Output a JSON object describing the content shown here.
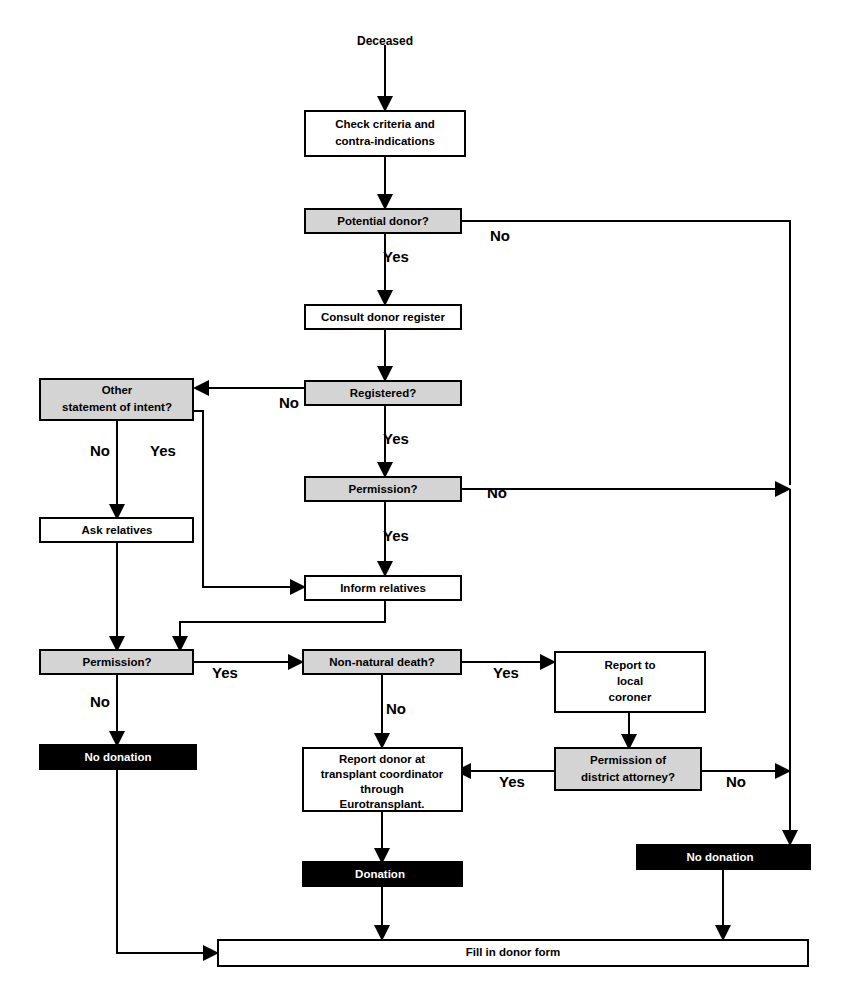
{
  "diagram": {
    "start_label": "Deceased",
    "colors": {
      "decision_fill": "#d4d4d4",
      "process_fill": "#ffffff",
      "terminal_fill": "#000000",
      "terminal_text": "#ffffff",
      "line": "#000000"
    },
    "nodes": [
      {
        "id": "start",
        "kind": "label",
        "lines": [
          "Deceased"
        ],
        "x": 305,
        "y": 30,
        "w": 160,
        "h": 24
      },
      {
        "id": "check_criteria",
        "kind": "process",
        "lines": [
          "Check criteria and",
          "contra-indications"
        ],
        "x": 305,
        "y": 111,
        "w": 160,
        "h": 45
      },
      {
        "id": "potential_donor",
        "kind": "decision",
        "lines": [
          "Potential donor?"
        ],
        "x": 305,
        "y": 209,
        "w": 156,
        "h": 24
      },
      {
        "id": "consult_register",
        "kind": "process",
        "lines": [
          "Consult donor register"
        ],
        "x": 305,
        "y": 305,
        "w": 156,
        "h": 24
      },
      {
        "id": "registered",
        "kind": "decision",
        "lines": [
          "Registered?"
        ],
        "x": 305,
        "y": 381,
        "w": 156,
        "h": 24
      },
      {
        "id": "other_statement",
        "kind": "decision",
        "lines": [
          "Other",
          "statement of intent?"
        ],
        "x": 40,
        "y": 379,
        "w": 153,
        "h": 41
      },
      {
        "id": "permission_reg",
        "kind": "decision",
        "lines": [
          "Permission?"
        ],
        "x": 305,
        "y": 477,
        "w": 156,
        "h": 24
      },
      {
        "id": "ask_relatives",
        "kind": "process",
        "lines": [
          "Ask relatives"
        ],
        "x": 40,
        "y": 518,
        "w": 153,
        "h": 24
      },
      {
        "id": "inform_relatives",
        "kind": "process",
        "lines": [
          "Inform relatives"
        ],
        "x": 305,
        "y": 576,
        "w": 156,
        "h": 24
      },
      {
        "id": "permission_rel",
        "kind": "decision",
        "lines": [
          "Permission?"
        ],
        "x": 40,
        "y": 650,
        "w": 153,
        "h": 24
      },
      {
        "id": "non_natural",
        "kind": "decision",
        "lines": [
          "Non-natural death?"
        ],
        "x": 303,
        "y": 650,
        "w": 158,
        "h": 24
      },
      {
        "id": "report_coroner",
        "kind": "process",
        "lines": [
          "Report to",
          "local",
          "coroner"
        ],
        "x": 555,
        "y": 652,
        "w": 150,
        "h": 60
      },
      {
        "id": "no_donation_left",
        "kind": "terminal",
        "lines": [
          "No donation"
        ],
        "x": 40,
        "y": 745,
        "w": 156,
        "h": 24
      },
      {
        "id": "report_donor",
        "kind": "process",
        "lines": [
          "Report donor at",
          "transplant coordinator",
          "through",
          "Eurotransplant."
        ],
        "x": 303,
        "y": 748,
        "w": 159,
        "h": 63
      },
      {
        "id": "permission_da",
        "kind": "decision",
        "lines": [
          "Permission of",
          "district attorney?"
        ],
        "x": 555,
        "y": 748,
        "w": 146,
        "h": 42
      },
      {
        "id": "donation",
        "kind": "terminal",
        "lines": [
          "Donation"
        ],
        "x": 303,
        "y": 862,
        "w": 159,
        "h": 24
      },
      {
        "id": "no_donation_right",
        "kind": "terminal",
        "lines": [
          "No donation"
        ],
        "x": 637,
        "y": 845,
        "w": 173,
        "h": 24
      },
      {
        "id": "fill_form",
        "kind": "process",
        "lines": [
          "Fill in  donor form"
        ],
        "x": 218,
        "y": 940,
        "w": 590,
        "h": 26
      }
    ],
    "edge_labels": [
      {
        "id": "potential_no",
        "text": "No",
        "x": 500,
        "y": 237
      },
      {
        "id": "potential_yes",
        "text": "Yes",
        "x": 396,
        "y": 258
      },
      {
        "id": "registered_no",
        "text": "No",
        "x": 289,
        "y": 404
      },
      {
        "id": "registered_yes",
        "text": "Yes",
        "x": 396,
        "y": 440
      },
      {
        "id": "other_no",
        "text": "No",
        "x": 100,
        "y": 452
      },
      {
        "id": "other_yes",
        "text": "Yes",
        "x": 163,
        "y": 452
      },
      {
        "id": "permission_no_r",
        "text": "No",
        "x": 497,
        "y": 494
      },
      {
        "id": "permission_yes_r",
        "text": "Yes",
        "x": 396,
        "y": 537
      },
      {
        "id": "perm_rel_yes",
        "text": "Yes",
        "x": 225,
        "y": 674
      },
      {
        "id": "perm_rel_no",
        "text": "No",
        "x": 100,
        "y": 703
      },
      {
        "id": "nonnat_yes",
        "text": "Yes",
        "x": 506,
        "y": 674
      },
      {
        "id": "nonnat_no",
        "text": "No",
        "x": 396,
        "y": 710
      },
      {
        "id": "da_yes",
        "text": "Yes",
        "x": 512,
        "y": 783
      },
      {
        "id": "da_no",
        "text": "No",
        "x": 736,
        "y": 783
      }
    ]
  }
}
